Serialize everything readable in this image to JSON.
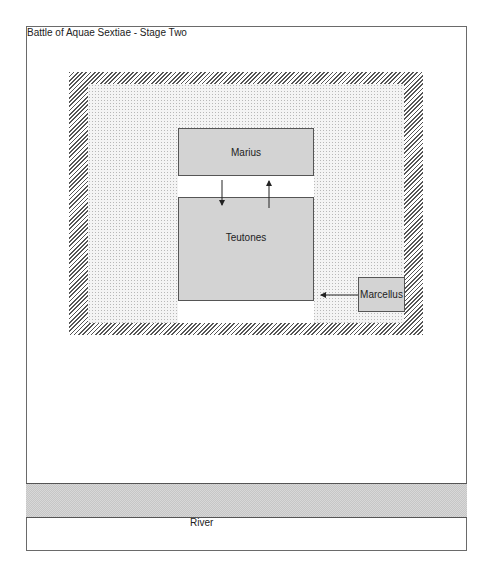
{
  "title": "Battle of Aquae Sextiae - Stage Two",
  "units": {
    "marius": "Marius",
    "teutones": "Teutones",
    "marcellus": "Marcellus"
  },
  "terrain": {
    "river": "River"
  },
  "colors": {
    "unit_fill": "#d3d3d3",
    "border": "#555555",
    "hatch": "#555555",
    "background": "#ffffff"
  }
}
